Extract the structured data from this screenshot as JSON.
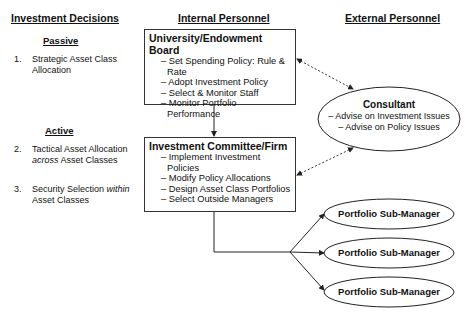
{
  "columns": {
    "decisions": "Investment Decisions",
    "internal": "Internal Personnel",
    "external": "External Personnel"
  },
  "decisions": {
    "passive": {
      "label": "Passive",
      "items": [
        {
          "num": "1.",
          "text": "Strategic Asset Class Allocation"
        }
      ]
    },
    "active": {
      "label": "Active",
      "items": [
        {
          "num": "2.",
          "text_a": "Tactical Asset Allocation",
          "text_em": "across",
          "text_b": "Asset Classes"
        },
        {
          "num": "3.",
          "text_a": "Security Selection",
          "text_em": "within",
          "text_b": "Asset Classes"
        }
      ]
    }
  },
  "board": {
    "title": "University/Endowment Board",
    "items": [
      "– Set Spending Policy: Rule & Rate",
      "– Adopt Investment Policy",
      "– Select & Monitor Staff",
      "– Monitor Portfolio Performance"
    ]
  },
  "committee": {
    "title": "Investment Committee/Firm",
    "items": [
      "– Implement Investment Policies",
      "– Modify Policy Allocations",
      "– Design Asset Class Portfolios",
      "– Select Outside Managers"
    ]
  },
  "consultant": {
    "title": "Consultant",
    "items": [
      "– Advise on Investment Issues",
      "– Advise on Policy Issues"
    ]
  },
  "sub_managers": [
    {
      "label": "Portfolio Sub-Manager"
    },
    {
      "label": "Portfolio Sub-Manager"
    },
    {
      "label": "Portfolio Sub-Manager"
    }
  ]
}
